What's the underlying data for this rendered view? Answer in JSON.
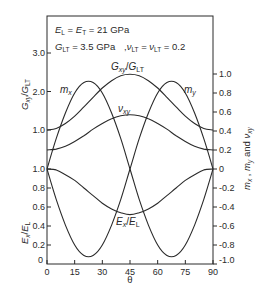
{
  "chart_data": {
    "type": "line",
    "title": "",
    "annotations": [
      "E_L = E_T = 21 GPa",
      "G_LT = 3.5 GPa   , ν_LT = ν_LT = 0.2"
    ],
    "xlabel": "θ",
    "x_ticks": [
      "0",
      "15",
      "30",
      "45",
      "60",
      "75",
      "90"
    ],
    "xlim": [
      0,
      90
    ],
    "axes": {
      "left_upper": {
        "label": "G_xy/G_LT",
        "ticks": [
          "1.0",
          "2.0",
          "3.0"
        ],
        "range": [
          1.0,
          3.0
        ]
      },
      "left_lower": {
        "label": "E_x/E_L",
        "ticks": [
          "0",
          "0.2",
          "0.4",
          "0.6",
          "0.8",
          "1.0"
        ],
        "range": [
          0,
          1.0
        ]
      },
      "right": {
        "label": "m_x , m_y and ν_xy",
        "ticks": [
          "-1.0",
          "-0.8",
          "-0.6",
          "-0.4",
          "-0.2",
          "0",
          "0.2",
          "0.4",
          "0.6",
          "0.8",
          "1.0"
        ],
        "range": [
          -1.0,
          1.0
        ]
      }
    },
    "x": [
      0,
      5,
      10,
      15,
      20,
      25,
      30,
      35,
      40,
      45,
      50,
      55,
      60,
      65,
      70,
      75,
      80,
      85,
      90
    ],
    "series": [
      {
        "name": "G_xy/G_LT",
        "axis": "left_upper",
        "values": [
          1.0,
          1.04,
          1.17,
          1.36,
          1.6,
          1.85,
          2.09,
          2.28,
          2.41,
          2.45,
          2.41,
          2.28,
          2.09,
          1.85,
          1.6,
          1.36,
          1.17,
          1.04,
          1.0
        ]
      },
      {
        "name": "ν_xy",
        "axis": "right",
        "values": [
          0.2,
          0.21,
          0.24,
          0.29,
          0.35,
          0.42,
          0.48,
          0.53,
          0.56,
          0.57,
          0.56,
          0.53,
          0.48,
          0.42,
          0.35,
          0.29,
          0.24,
          0.21,
          0.2
        ]
      },
      {
        "name": "m_x",
        "axis": "right",
        "values": [
          0,
          0.32,
          0.59,
          0.8,
          0.91,
          0.91,
          0.8,
          0.59,
          0.32,
          0,
          -0.32,
          -0.59,
          -0.8,
          -0.91,
          -0.91,
          -0.8,
          -0.59,
          -0.32,
          0
        ]
      },
      {
        "name": "m_y",
        "axis": "right",
        "values": [
          0,
          -0.32,
          -0.59,
          -0.8,
          -0.91,
          -0.91,
          -0.8,
          -0.59,
          -0.32,
          0,
          0.32,
          0.59,
          0.8,
          0.91,
          0.91,
          0.8,
          0.59,
          0.32,
          0
        ]
      },
      {
        "name": "E_x/E_L",
        "axis": "left_lower",
        "values": [
          1.0,
          0.99,
          0.94,
          0.88,
          0.8,
          0.72,
          0.64,
          0.58,
          0.54,
          0.52,
          0.54,
          0.58,
          0.64,
          0.72,
          0.8,
          0.88,
          0.94,
          0.99,
          1.0
        ]
      }
    ],
    "curve_labels": {
      "gxy": "G_xy/G_LT",
      "mx": "m_x",
      "my": "m_y",
      "vxy": "ν_xy",
      "ex": "E_x/E_L"
    },
    "grid": false,
    "legend": "none (inline labels)"
  }
}
